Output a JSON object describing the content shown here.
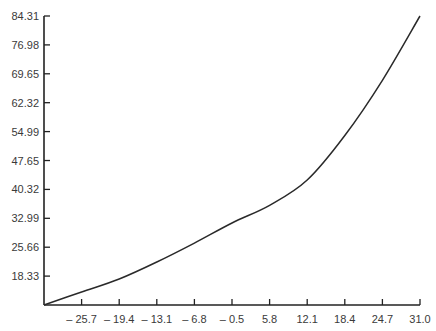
{
  "chart_data": {
    "type": "line",
    "title": "",
    "xlabel": "",
    "ylabel": "",
    "x_ticks": [
      "-25.7",
      "-19.4",
      "-13.1",
      "-6.8",
      "-0.5",
      "5.8",
      "12.1",
      "18.4",
      "24.7",
      "31.0"
    ],
    "y_ticks": [
      "18.33",
      "25.66",
      "32.99",
      "40.32",
      "47.65",
      "54.99",
      "62.32",
      "69.65",
      "76.98",
      "84.31"
    ],
    "xlim": [
      -32.0,
      31.0
    ],
    "ylim": [
      11.0,
      84.31
    ],
    "grid": false,
    "legend": null,
    "series": [
      {
        "name": "curve",
        "x": [
          -32.0,
          -25.7,
          -19.4,
          -13.1,
          -6.8,
          -0.5,
          5.8,
          12.1,
          18.4,
          24.7,
          31.0
        ],
        "y": [
          11.0,
          14.3,
          17.6,
          21.9,
          26.7,
          31.8,
          36.3,
          42.7,
          54.0,
          68.0,
          84.31
        ]
      }
    ]
  },
  "axes": {
    "x_tick_prefix_note": "minus signs shown with a space before the number"
  }
}
